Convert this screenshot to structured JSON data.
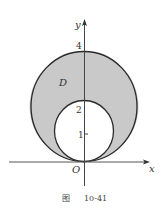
{
  "figure": {
    "caption_prefix": "图",
    "caption_number": "10-41",
    "region_label": "D",
    "origin_label": "O",
    "x_axis_label": "x",
    "y_axis_label": "y",
    "y_ticks": [
      {
        "value": 1,
        "label": "1"
      },
      {
        "value": 2,
        "label": "2"
      },
      {
        "value": 4,
        "label": "4"
      }
    ]
  },
  "shapes": {
    "outer_circle": {
      "center": [
        0,
        2
      ],
      "radius": 2,
      "equation": "x^2 + (y-2)^2 = 4"
    },
    "inner_circle": {
      "center": [
        0,
        1
      ],
      "radius": 1,
      "equation": "x^2 + (y-1)^2 = 1"
    },
    "shaded_region": "D: between inner and outer circles"
  },
  "colors": {
    "fill": "#c9c9c9",
    "stroke": "#2a2a2a",
    "background": "#ffffff"
  }
}
